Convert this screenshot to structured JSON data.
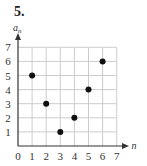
{
  "problem_number": "5.",
  "chart_data": {
    "type": "scatter",
    "title": "",
    "xlabel": "n",
    "ylabel": "a_n",
    "ylabel_display": "a",
    "ylabel_sub": "n",
    "x": [
      1,
      2,
      3,
      4,
      5,
      6
    ],
    "y": [
      5,
      3,
      1,
      2,
      4,
      6
    ],
    "xlim": [
      0,
      7
    ],
    "ylim": [
      0,
      7
    ],
    "xticks": [
      "0",
      "1",
      "2",
      "3",
      "4",
      "5",
      "6",
      "7"
    ],
    "yticks": [
      "1",
      "2",
      "3",
      "4",
      "5",
      "6",
      "7"
    ],
    "grid": true,
    "legend": null,
    "point_color": "#111111",
    "grid_color": "#cccccc",
    "axis_color": "#333333"
  }
}
